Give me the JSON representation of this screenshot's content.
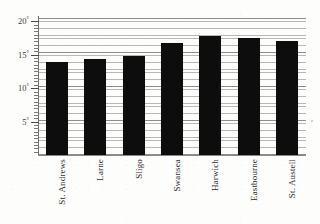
{
  "figure": {
    "caption_cropped": "Average daytime temperature",
    "background_color": "#fdfdfc",
    "bar_color": "#0d0d0d",
    "grid_color": "#b8b8b4",
    "axis_color": "#6e6e6a"
  },
  "chart_data": {
    "type": "bar",
    "title": "",
    "xlabel": "",
    "ylabel": "",
    "categories": [
      "St. Andrews",
      "Larne",
      "Sligo",
      "Swansea",
      "Harwich",
      "Eastbourne",
      "St. Austell"
    ],
    "values": [
      13.9,
      14.4,
      14.8,
      16.8,
      17.8,
      17.5,
      17.1
    ],
    "ylim": [
      0,
      20.5
    ],
    "ytick_values": [
      5,
      10,
      15,
      20
    ],
    "ytick_labels": [
      "5",
      "10",
      "15",
      "20"
    ],
    "ytick_suffix": "°",
    "minor_tick_step": 0.5,
    "grid": true,
    "grid_orientation": "horizontal",
    "legend": null,
    "xtick_rotation": 90,
    "series": [
      {
        "name": "Temperature",
        "values": [
          13.9,
          14.4,
          14.8,
          16.8,
          17.8,
          17.5,
          17.1
        ]
      }
    ]
  }
}
